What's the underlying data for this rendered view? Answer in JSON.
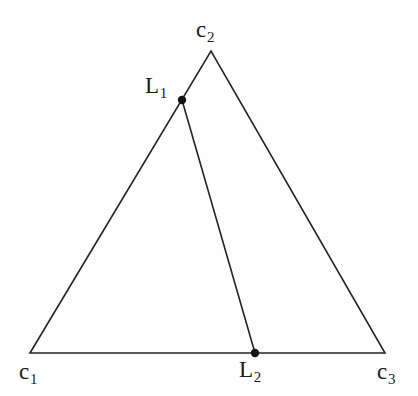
{
  "figure": {
    "background_color": "#fefefe",
    "stroke_color": "#242424",
    "stroke_width": 1.6,
    "point_color": "#141414",
    "point_radius": 4.2,
    "width": 418,
    "height": 396
  },
  "labels": {
    "c1": {
      "base": "c",
      "sub": "1"
    },
    "c2": {
      "base": "c",
      "sub": "2"
    },
    "c3": {
      "base": "c",
      "sub": "3"
    },
    "L1": {
      "base": "L",
      "sub": "1"
    },
    "L2": {
      "base": "L",
      "sub": "2"
    }
  },
  "chart_data": {
    "type": "scatter",
    "xlabel": "",
    "ylabel": "",
    "xlim": [
      0,
      418
    ],
    "ylim": [
      396,
      0
    ],
    "grid": false,
    "legend": "none",
    "points": [
      {
        "name": "c1",
        "label": "c₁",
        "x": 30,
        "y": 353,
        "marked": false
      },
      {
        "name": "c2",
        "label": "c₂",
        "x": 211,
        "y": 51,
        "marked": false
      },
      {
        "name": "c3",
        "label": "c₃",
        "x": 385,
        "y": 353,
        "marked": false
      },
      {
        "name": "L1",
        "label": "L₁",
        "x": 182,
        "y": 100,
        "marked": true
      },
      {
        "name": "L2",
        "label": "L₂",
        "x": 255,
        "y": 353,
        "marked": true
      }
    ],
    "segments": [
      {
        "name": "side-c1-c2",
        "from": "c1",
        "to": "c2"
      },
      {
        "name": "side-c2-c3",
        "from": "c2",
        "to": "c3"
      },
      {
        "name": "side-c1-c3",
        "from": "c1",
        "to": "c3"
      },
      {
        "name": "interior-L1-L2",
        "from": "L1",
        "to": "L2"
      }
    ],
    "annotations": [
      "L1 lies on side c1-c2",
      "L2 lies on side c1-c3",
      "segment L1-L2 divides the triangle"
    ]
  }
}
